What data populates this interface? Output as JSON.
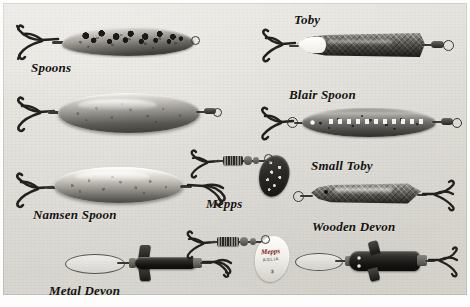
{
  "figure": {
    "kind": "photograph",
    "background_color": "#e6e4de",
    "border_color": "#ffffff",
    "caption_color": "#14120f"
  },
  "labels": [
    {
      "id": "spoons",
      "text": "Spoons",
      "x": 28,
      "y": 57,
      "size": 13
    },
    {
      "id": "toby",
      "text": "Toby",
      "x": 291,
      "y": 10,
      "size": 13
    },
    {
      "id": "blair-spoon",
      "text": "Blair Spoon",
      "x": 286,
      "y": 85,
      "size": 13
    },
    {
      "id": "namsen-spoon",
      "text": "Namsen Spoon",
      "x": 30,
      "y": 205,
      "size": 13
    },
    {
      "id": "mepps",
      "text": "Mepps",
      "x": 203,
      "y": 194,
      "size": 13
    },
    {
      "id": "small-toby",
      "text": "Small Toby",
      "x": 308,
      "y": 156,
      "size": 13
    },
    {
      "id": "wooden-devon",
      "text": "Wooden Devon",
      "x": 309,
      "y": 217,
      "size": 13
    },
    {
      "id": "metal-devon",
      "text": "Metal Devon",
      "x": 46,
      "y": 281,
      "size": 13
    }
  ],
  "lures": [
    {
      "id": "spotted-spoon",
      "label": "Spoons",
      "description": "Leaf-shaped silver spoon with dark spotted upper surface and treble hook at the head",
      "finish": "silver with black spots",
      "hook": "treble",
      "blade_shape": "leaf"
    },
    {
      "id": "plain-spoon",
      "label": "Spoons",
      "description": "Broad plain polished oval spoon with treble hook and swivel link",
      "finish": "polished silver",
      "hook": "treble",
      "blade_shape": "oval"
    },
    {
      "id": "namsen-spoon",
      "label": "Namsen Spoon",
      "description": "Large elongated bright silver spoon with treble hooks at both ends",
      "finish": "bright silver",
      "hook": "treble",
      "blade_shape": "elongated oval"
    },
    {
      "id": "metal-devon",
      "label": "Metal Devon",
      "description": "Black metal Devon minnow with cross vanes, wire loop trace and treble hook",
      "finish": "black metal",
      "hook": "treble",
      "blade_shape": "tube with vanes"
    },
    {
      "id": "mepps-dark",
      "label": "Mepps",
      "description": "Mepps spinner with dark spotted oval blade, beaded body and treble hook",
      "finish": "dark blade with light spots",
      "hook": "treble",
      "blade_shape": "willow/oval spinner blade"
    },
    {
      "id": "mepps-white",
      "label": "Mepps",
      "description": "Mepps spinner with white oval blade carrying red brand print, beaded body and treble hook",
      "finish": "white blade",
      "hook": "treble",
      "blade_shape": "oval spinner blade",
      "blade_print": {
        "brand": "Mepps",
        "subtitle": "AGLIA",
        "size_mark": "3"
      }
    },
    {
      "id": "toby",
      "label": "Toby",
      "description": "Long slim Toby wobbler, silver scale pattern with white head patch, treble hook and swivel",
      "finish": "silver scale / dark back",
      "hook": "treble",
      "blade_shape": "slim elongated wobbler"
    },
    {
      "id": "blair-spoon",
      "label": "Blair Spoon",
      "description": "Rounded elongated Blair spoon with mottled silver finish and treble hook on a link",
      "finish": "mottled silver",
      "hook": "treble",
      "blade_shape": "rounded elongated"
    },
    {
      "id": "small-toby",
      "label": "Small Toby",
      "description": "Smaller Toby wobbler with split ring at nose and treble hook at tail",
      "finish": "silver scale / dark back",
      "hook": "treble",
      "blade_shape": "slim wobbler"
    },
    {
      "id": "wooden-devon",
      "label": "Wooden Devon",
      "description": "Dark wooden Devon minnow with paired vanes, wire loop trace and tail treble hook",
      "finish": "dark stained wood",
      "hook": "treble",
      "blade_shape": "minnow body with vanes"
    }
  ]
}
